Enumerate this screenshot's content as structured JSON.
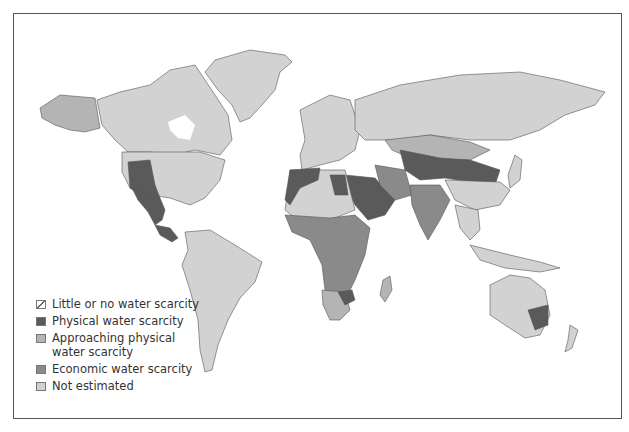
{
  "map": {
    "title": "",
    "subject": "World water scarcity",
    "colors": {
      "little": "#ffffff",
      "physical": "#5a5a5a",
      "approaching": "#b4b4b4",
      "economic": "#8a8a8a",
      "not_estimated": "#d2d2d2",
      "frame": "#555555"
    }
  },
  "legend": {
    "items": [
      {
        "label": "Little or no water scarcity",
        "key": "little"
      },
      {
        "label": "Physical water scarcity",
        "key": "physical"
      },
      {
        "label": "Approaching physical water scarcity",
        "line1": "Approaching physical",
        "line2": "water scarcity",
        "key": "approaching"
      },
      {
        "label": "Economic water scarcity",
        "key": "economic"
      },
      {
        "label": "Not estimated",
        "key": "not_estimated"
      }
    ]
  }
}
